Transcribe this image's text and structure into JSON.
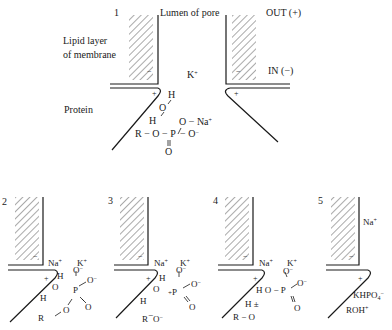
{
  "panel1": {
    "number": "1",
    "lumen_label": "Lumen of pore",
    "out_label": "OUT (+)",
    "in_label": "IN (−)",
    "lipid_label_line1": "Lipid layer",
    "lipid_label_line2": "of membrane",
    "protein_label": "Protein",
    "ion_k": "K",
    "ion_na": "Na",
    "chem": {
      "h_top": "H",
      "o_mid": "O",
      "h_low": "H",
      "o_minus_na": "O −",
      "chain": "R − O − P",
      "o_minus": "− O",
      "o_double": "O"
    }
  },
  "panel2": {
    "number": "2",
    "ion_na": "Na",
    "ion_k": "K",
    "chem": {
      "h1": "H",
      "o1": "O",
      "h2": "H",
      "o_top": "O",
      "p": "P",
      "o_right": "O",
      "o_double": "O",
      "o_bridge": "O",
      "r": "R"
    }
  },
  "panel3": {
    "number": "3",
    "ion_na": "Na",
    "ion_k": "K",
    "chem": {
      "h1": "H",
      "o1": "O",
      "h2": "H",
      "o_top": "O",
      "p": "P",
      "o_right": "O",
      "o_double": "O",
      "ro": "R",
      "o_ro": "O"
    }
  },
  "panel4": {
    "number": "4",
    "ion_na": "Na",
    "ion_k": "K",
    "chem": {
      "h_o": "H O − P",
      "o_top": "O",
      "o_right": "O",
      "o_double": "O",
      "h_pm": "H",
      "pm": "±",
      "ro": "R − O"
    }
  },
  "panel5": {
    "number": "5",
    "ion_na": "Na",
    "product1": "KHPO",
    "product1_sub": "4",
    "product2": "ROH"
  },
  "charges": {
    "plus": "+",
    "minus": "−"
  }
}
